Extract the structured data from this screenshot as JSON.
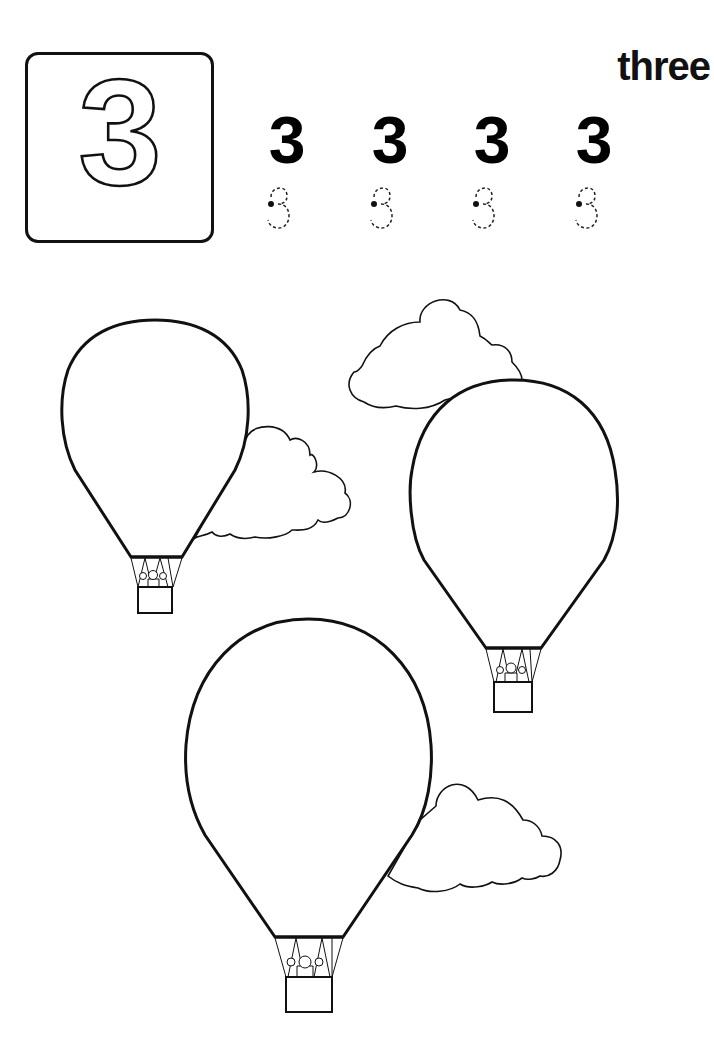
{
  "worksheet": {
    "featured_number": "3",
    "number_word": "three",
    "practice_digits": [
      "3",
      "3",
      "3",
      "3"
    ],
    "tracing_digits": [
      "3",
      "3",
      "3",
      "3"
    ],
    "illustration": {
      "balloons": [
        {
          "id": "balloon-1",
          "size": "small",
          "passenger": "monkey"
        },
        {
          "id": "balloon-2",
          "size": "medium",
          "passenger": "monkey"
        },
        {
          "id": "balloon-3",
          "size": "large",
          "passenger": "monkey"
        }
      ],
      "clouds": [
        "cloud-1",
        "cloud-2",
        "cloud-3"
      ],
      "balloon_count": 3
    },
    "colors": {
      "ink": "#111111",
      "paper": "#ffffff"
    }
  }
}
